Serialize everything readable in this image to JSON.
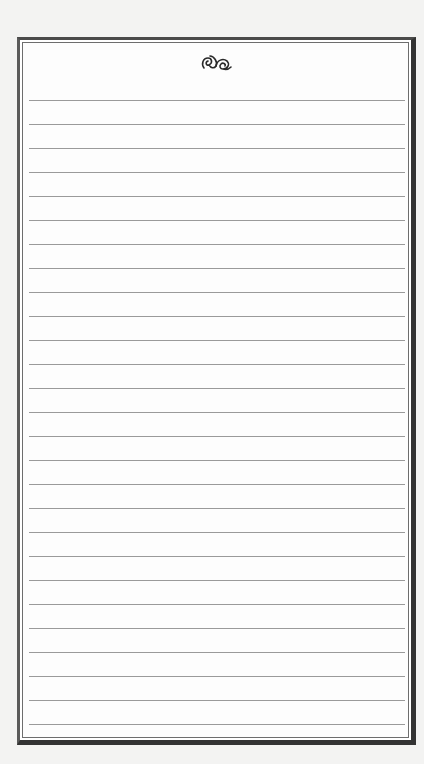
{
  "page": {
    "type": "lined-notepaper",
    "ornament_icon": "fleuron-ornament-icon",
    "line_count": 27,
    "line_start_y": 57,
    "line_spacing": 24,
    "colors": {
      "background": "#f3f3f2",
      "paper": "#ffffff",
      "frame": "#333333",
      "rule_line": "#9a9a9a",
      "ornament": "#2a2a2a"
    },
    "lines": []
  }
}
